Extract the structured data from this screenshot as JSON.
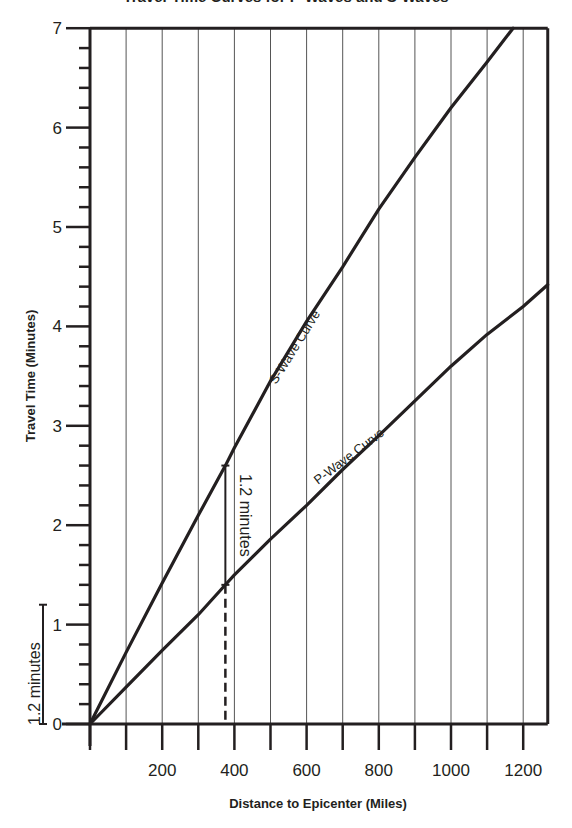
{
  "chart_data": {
    "type": "line",
    "title": "Travel-Time Curves for P-Waves and S-Waves",
    "xlabel": "Distance to Epicenter  (Miles)",
    "ylabel": "Travel Time (Minutes)",
    "xlim": [
      0,
      1268
    ],
    "ylim": [
      0,
      7
    ],
    "x_tick_labels": [
      "200",
      "400",
      "600",
      "800",
      "1000",
      "1200"
    ],
    "x_tick_values": [
      200,
      400,
      600,
      800,
      1000,
      1200
    ],
    "x_minor_tick_step": 100,
    "y_tick_labels": [
      "0",
      "1",
      "2",
      "3",
      "4",
      "5",
      "6",
      "7"
    ],
    "y_tick_values": [
      0,
      1,
      2,
      3,
      4,
      5,
      6,
      7
    ],
    "y_minor_tick_step": 0.2,
    "grid": {
      "vertical": true,
      "horizontal": false,
      "step": 100
    },
    "series": [
      {
        "name": "S-Wave Curve",
        "x": [
          0,
          100,
          200,
          300,
          375,
          400,
          500,
          600,
          700,
          800,
          900,
          1000,
          1100,
          1172
        ],
        "values": [
          0,
          0.72,
          1.42,
          2.1,
          2.6,
          2.78,
          3.45,
          4.05,
          4.6,
          5.18,
          5.7,
          6.2,
          6.66,
          7.0
        ]
      },
      {
        "name": "P-Wave Curve",
        "x": [
          0,
          100,
          200,
          300,
          375,
          400,
          500,
          600,
          700,
          800,
          900,
          1000,
          1100,
          1200,
          1268
        ],
        "values": [
          0,
          0.37,
          0.74,
          1.1,
          1.4,
          1.5,
          1.86,
          2.2,
          2.56,
          2.9,
          3.25,
          3.6,
          3.92,
          4.2,
          4.42
        ]
      }
    ],
    "annotations": [
      {
        "text": "1.2 minutes",
        "type": "bracket",
        "x": 375,
        "y_from": 1.4,
        "y_to": 2.6
      },
      {
        "text": "1.2 minutes",
        "type": "scale-bracket",
        "position": "left-of-y-axis",
        "y_from": 0,
        "y_to": 1.2
      },
      {
        "type": "dashed-line",
        "x": 375,
        "y_from": 0,
        "y_to": 1.4
      }
    ]
  },
  "labels": {
    "title": "Travel-Time Curves for P-Waves and S-Waves",
    "xlabel": "Distance to Epicenter  (Miles)",
    "ylabel": "Travel Time (Minutes)",
    "s_curve": "S-Wave Curve",
    "p_curve": "P-Wave Curve",
    "bracket_mid": "1.2 minutes",
    "bracket_left": "1.2 minutes"
  },
  "colors": {
    "ink": "#231f20",
    "grid": "#555555",
    "background": "#ffffff"
  }
}
